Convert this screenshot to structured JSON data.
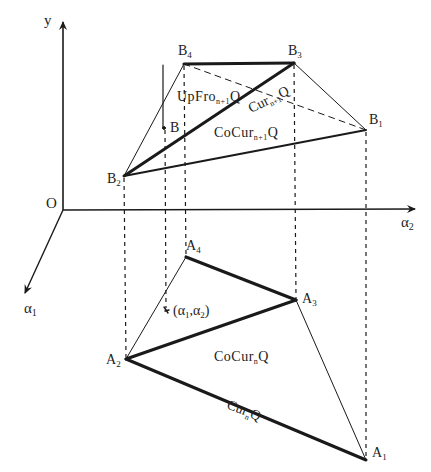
{
  "diagram": {
    "type": "projection-geometry",
    "colors": {
      "line": "#1a1a1a",
      "text": "#222222",
      "background": "#ffffff"
    },
    "axes": {
      "origin": {
        "label": "O"
      },
      "y": {
        "label": "y"
      },
      "alpha2": {
        "label": "α",
        "sub": "2"
      },
      "alpha1": {
        "label": "α",
        "sub": "1"
      }
    },
    "upper_points": {
      "B4": {
        "label": "B",
        "sub": "4"
      },
      "B3": {
        "label": "B",
        "sub": "3"
      },
      "B1": {
        "label": "B",
        "sub": "1"
      },
      "B2": {
        "label": "B",
        "sub": "2"
      },
      "B": {
        "label": "B"
      }
    },
    "lower_points": {
      "A4": {
        "label": "A",
        "sub": "4"
      },
      "A3": {
        "label": "A",
        "sub": "3"
      },
      "A2": {
        "label": "A",
        "sub": "2"
      },
      "A1": {
        "label": "A",
        "sub": "1"
      },
      "P": {
        "label": "(α",
        "sub1": "1",
        "mid": ",α",
        "sub2": "2",
        "end": ")"
      }
    },
    "region_labels": {
      "upfro": {
        "main": "UpFro",
        "sub": "n+1",
        "tail": "Q"
      },
      "cur_n1": {
        "main": "Cur",
        "sub": "n+1",
        "tail": "Q"
      },
      "cocur_n1": {
        "main": "CoCur",
        "sub": "n+1",
        "tail": "Q"
      },
      "cocur_n": {
        "main": "CoCur",
        "sub": "n",
        "tail": "Q"
      },
      "cur_n": {
        "main": "Cur",
        "sub": "n",
        "tail": "Q"
      }
    }
  }
}
